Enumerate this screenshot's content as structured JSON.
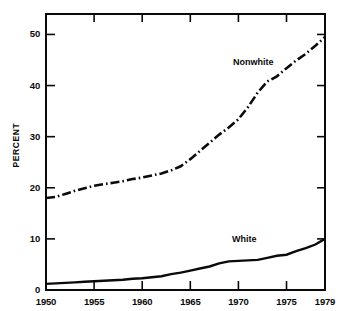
{
  "figure": {
    "background_color": "#ffffff",
    "ink_color": "#0a0a0a"
  },
  "axis_titles": {
    "y": "PERCENT",
    "x": ""
  },
  "y_ticks": [
    "0",
    "10",
    "20",
    "30",
    "40",
    "50"
  ],
  "x_ticks": [
    "1950",
    "1955",
    "1960",
    "1965",
    "1970",
    "1975",
    "1979"
  ],
  "series_labels": {
    "nonwhite": "Nonwhite",
    "white": "White"
  },
  "chart_data": {
    "type": "line",
    "title": "",
    "subtitle": "",
    "xlabel": "",
    "ylabel": "PERCENT",
    "xlim": [
      1950,
      1979
    ],
    "ylim": [
      0,
      54
    ],
    "grid": false,
    "legend_position": "inline-annotation",
    "xticks": [
      1950,
      1955,
      1960,
      1965,
      1970,
      1975,
      1979
    ],
    "yticks": [
      0,
      10,
      20,
      30,
      40,
      50
    ],
    "x": [
      1950,
      1951,
      1952,
      1953,
      1954,
      1955,
      1956,
      1957,
      1958,
      1959,
      1960,
      1961,
      1962,
      1963,
      1964,
      1965,
      1966,
      1967,
      1968,
      1969,
      1970,
      1971,
      1972,
      1973,
      1974,
      1975,
      1976,
      1977,
      1978,
      1979
    ],
    "series": [
      {
        "name": "Nonwhite",
        "style": "dash-dot",
        "color": "#0a0a0a",
        "values": [
          18.0,
          18.2,
          18.8,
          19.4,
          19.9,
          20.4,
          20.7,
          21.0,
          21.3,
          21.7,
          22.0,
          22.4,
          22.8,
          23.4,
          24.2,
          25.6,
          27.2,
          28.8,
          30.4,
          31.8,
          33.4,
          35.8,
          38.6,
          40.8,
          41.8,
          43.4,
          44.9,
          46.2,
          47.8,
          49.5
        ]
      },
      {
        "name": "White",
        "style": "solid",
        "color": "#0a0a0a",
        "values": [
          1.2,
          1.3,
          1.4,
          1.5,
          1.6,
          1.7,
          1.8,
          1.9,
          2.0,
          2.2,
          2.3,
          2.5,
          2.7,
          3.1,
          3.4,
          3.8,
          4.2,
          4.6,
          5.2,
          5.6,
          5.7,
          5.8,
          5.9,
          6.3,
          6.7,
          6.9,
          7.6,
          8.2,
          8.9,
          10.0
        ]
      }
    ],
    "annotations": [
      {
        "text": "Nonwhite",
        "x": 1971.5,
        "y": 45.5
      },
      {
        "text": "White",
        "x": 1971.0,
        "y": 13.0
      }
    ]
  }
}
